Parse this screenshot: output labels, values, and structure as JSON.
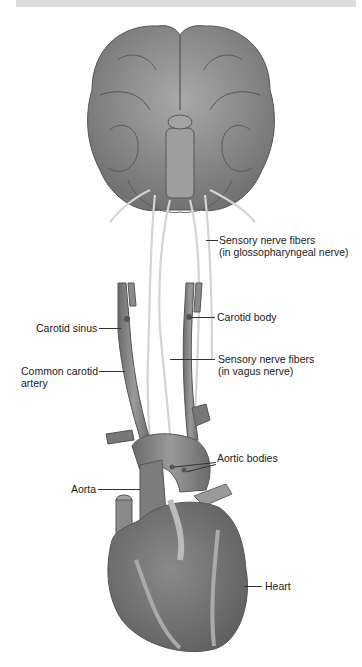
{
  "figure": {
    "colors": {
      "background": "#ffffff",
      "tissue_dark": "#6e6e6e",
      "tissue_mid": "#8c8c8c",
      "tissue_light": "#b4b4b4",
      "nerve": "#d6d6d6",
      "leader_line": "#333333",
      "top_bar": "#dcdcdc"
    },
    "labels": {
      "glossopharyngeal_1": "Sensory nerve fibers",
      "glossopharyngeal_2": "(in glossopharyngeal nerve)",
      "carotid_body": "Carotid body",
      "carotid_sinus": "Carotid sinus",
      "vagus_1": "Sensory nerve fibers",
      "vagus_2": "(in vagus nerve)",
      "common_carotid_1": "Common carotid",
      "common_carotid_2": "artery",
      "aortic_bodies": "Aortic bodies",
      "aorta": "Aorta",
      "heart": "Heart"
    }
  }
}
